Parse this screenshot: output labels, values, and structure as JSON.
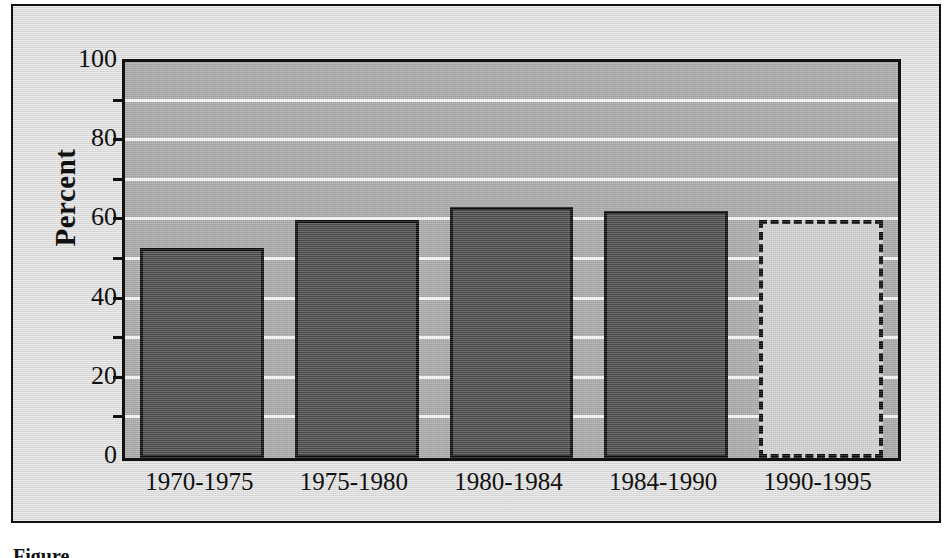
{
  "figure": {
    "caption": "Figure"
  },
  "chart_data": {
    "type": "bar",
    "title": "",
    "xlabel": "",
    "ylabel": "Percent",
    "categories": [
      "1970-1975",
      "1975-1980",
      "1980-1984",
      "1984-1990",
      "1990-1995"
    ],
    "values": [
      53,
      60,
      63.5,
      62.5,
      60
    ],
    "series": [
      {
        "name": "Percent",
        "values": [
          53,
          60,
          63.5,
          62.5,
          60
        ],
        "styles": [
          "solid",
          "solid",
          "solid",
          "solid",
          "dashed"
        ]
      }
    ],
    "ylim": [
      0,
      100
    ],
    "ytick_labels": [
      "0",
      "20",
      "40",
      "60",
      "80",
      "100"
    ],
    "ytick_values": [
      0,
      20,
      40,
      60,
      80,
      100
    ],
    "gridline_values": [
      10,
      20,
      30,
      40,
      50,
      60,
      70,
      80,
      90
    ],
    "grid": true,
    "legend": "none",
    "colors": {
      "bar_fill": "#4b4b4b",
      "bar_outline": "#0d0d0d",
      "projected_fill": "#cfcfcf",
      "projected_outline": "#0d0d0d",
      "plot_background": "#a9a9a9",
      "gridline": "#f4f4f4",
      "panel_background": "#d9d9d9",
      "frame": "#111111",
      "text": "#111111"
    }
  }
}
